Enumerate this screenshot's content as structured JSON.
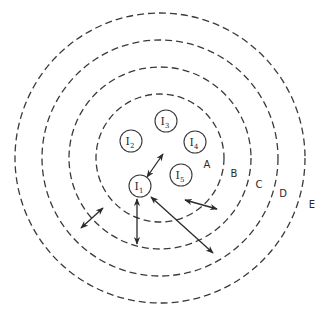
{
  "diagram": {
    "center": {
      "x": 160,
      "y": 158
    },
    "rings": [
      {
        "id": "ring-1",
        "radius": 64
      },
      {
        "id": "ring-2",
        "radius": 91
      },
      {
        "id": "ring-3",
        "radius": 118
      },
      {
        "id": "ring-4",
        "radius": 145
      }
    ],
    "zones": [
      {
        "label": "A",
        "x": 207,
        "y": 168
      },
      {
        "label": "B",
        "x": 234,
        "y": 177
      },
      {
        "label": "C",
        "x": 259,
        "y": 188
      },
      {
        "label": "D",
        "x": 283,
        "y": 197
      },
      {
        "label": "E",
        "x": 312,
        "y": 208
      }
    ],
    "nodes": [
      {
        "label": "I",
        "sub": "1",
        "x": 140,
        "y": 186
      },
      {
        "label": "I",
        "sub": "2",
        "x": 131,
        "y": 141
      },
      {
        "label": "I",
        "sub": "3",
        "x": 166,
        "y": 121
      },
      {
        "label": "I",
        "sub": "4",
        "x": 195,
        "y": 142
      },
      {
        "label": "I",
        "sub": "5",
        "x": 181,
        "y": 175
      }
    ],
    "node_radius": 11,
    "arrows": [
      {
        "id": "arrow-i1-inward",
        "x1": 147,
        "y1": 177,
        "x2": 163,
        "y2": 154
      },
      {
        "id": "arrow-i1-down",
        "x1": 137,
        "y1": 199,
        "x2": 137,
        "y2": 244
      },
      {
        "id": "arrow-i1-diagonal",
        "x1": 151,
        "y1": 197,
        "x2": 213,
        "y2": 253
      },
      {
        "id": "arrow-left-free",
        "x1": 81,
        "y1": 228,
        "x2": 103,
        "y2": 208
      },
      {
        "id": "arrow-right-free",
        "x1": 185,
        "y1": 200,
        "x2": 217,
        "y2": 209
      }
    ],
    "colors": {
      "stroke": "#3a3a3a",
      "text": "#2a2a2a",
      "background": "#ffffff"
    }
  }
}
